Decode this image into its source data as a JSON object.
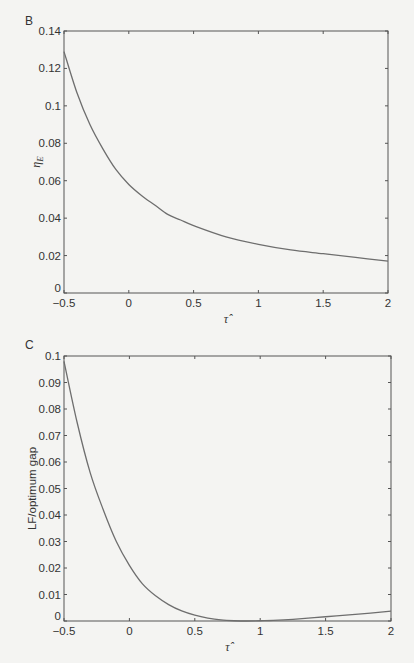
{
  "chart_data": [
    {
      "panel": "B",
      "type": "line",
      "title": "",
      "xlabel": "τ̂",
      "ylabel": "η_E",
      "xlim": [
        -0.5,
        2
      ],
      "ylim": [
        0,
        0.14
      ],
      "xticks": [
        -0.5,
        0,
        0.5,
        1,
        1.5,
        2
      ],
      "xtick_labels": [
        "−0.5",
        "0",
        "0.5",
        "1",
        "1.5",
        "2"
      ],
      "yticks": [
        0,
        0.02,
        0.04,
        0.06,
        0.08,
        0.1,
        0.12,
        0.14
      ],
      "ytick_labels": [
        "0",
        "0.02",
        "0.04",
        "0.06",
        "0.08",
        "0.1",
        "0.12",
        "0.14"
      ],
      "grid": false,
      "legend": null,
      "series": [
        {
          "name": "η_E",
          "color": "#6e6e6e",
          "x": [
            -0.5,
            -0.4,
            -0.3,
            -0.2,
            -0.1,
            0,
            0.1,
            0.2,
            0.3,
            0.4,
            0.5,
            0.75,
            1,
            1.25,
            1.5,
            1.75,
            2
          ],
          "y": [
            0.129,
            0.107,
            0.09,
            0.077,
            0.066,
            0.058,
            0.052,
            0.047,
            0.042,
            0.039,
            0.036,
            0.03,
            0.026,
            0.023,
            0.021,
            0.019,
            0.017
          ]
        }
      ]
    },
    {
      "panel": "C",
      "type": "line",
      "title": "",
      "xlabel": "τ̂",
      "ylabel": "LF/optimum gap",
      "xlim": [
        -0.5,
        2
      ],
      "ylim": [
        0,
        0.1
      ],
      "xticks": [
        -0.5,
        0,
        0.5,
        1,
        1.5,
        2
      ],
      "xtick_labels": [
        "−0.5",
        "0",
        "0.5",
        "1",
        "1.5",
        "2"
      ],
      "yticks": [
        0,
        0.01,
        0.02,
        0.03,
        0.04,
        0.05,
        0.06,
        0.07,
        0.08,
        0.09,
        0.1
      ],
      "ytick_labels": [
        "0",
        "0.01",
        "0.02",
        "0.03",
        "0.04",
        "0.05",
        "0.06",
        "0.07",
        "0.08",
        "0.09",
        "0.1"
      ],
      "grid": false,
      "legend": null,
      "series": [
        {
          "name": "LF/optimum gap",
          "color": "#6e6e6e",
          "x": [
            -0.5,
            -0.4,
            -0.3,
            -0.2,
            -0.1,
            0,
            0.1,
            0.2,
            0.3,
            0.4,
            0.5,
            0.6,
            0.7,
            0.8,
            0.9,
            1,
            1.1,
            1.25,
            1.5,
            1.75,
            2
          ],
          "y": [
            0.098,
            0.075,
            0.056,
            0.042,
            0.03,
            0.021,
            0.014,
            0.0095,
            0.0062,
            0.0038,
            0.0022,
            0.0011,
            0.0004,
            0.0001,
            0.0,
            0.0001,
            0.0002,
            0.0006,
            0.0016,
            0.0026,
            0.0037
          ]
        }
      ]
    }
  ],
  "panels": {
    "b_letter": "B",
    "c_letter": "C"
  },
  "bleed_through": {
    "line1": "contents of a portion of the text lies under the graph",
    "line2": "Running Costs Model"
  }
}
